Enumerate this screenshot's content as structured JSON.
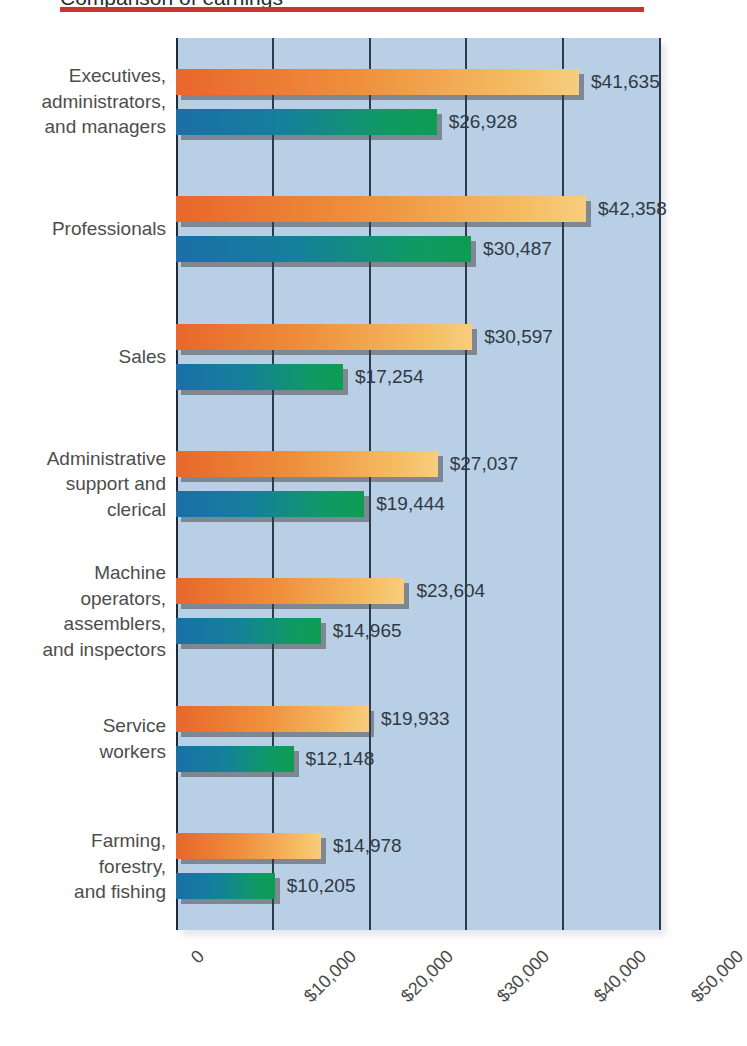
{
  "page": {
    "clipped_headline": "Comparison of earnings",
    "rule_color": "#c0392b",
    "plot_bg": "#b9cfe6"
  },
  "legend": {
    "position": "inside-right",
    "items": [
      {
        "label": "Male",
        "color": "#e8672a"
      },
      {
        "label": "Female",
        "color": "#1b6fa8"
      }
    ]
  },
  "axis": {
    "ticks": [
      "0",
      "$10,000",
      "$20,000",
      "$30,000",
      "$40,000",
      "$50,000"
    ]
  },
  "chart_data": {
    "type": "bar",
    "orientation": "horizontal",
    "title": "",
    "xlabel": "",
    "ylabel": "",
    "xlim": [
      0,
      50000
    ],
    "grid": true,
    "tick_values": [
      0,
      10000,
      20000,
      30000,
      40000,
      50000
    ],
    "tick_labels": [
      "0",
      "$10,000",
      "$20,000",
      "$30,000",
      "$40,000",
      "$50,000"
    ],
    "legend_position": "inside-right",
    "categories": [
      "Executives,\nadministrators,\nand managers",
      "Professionals",
      "Sales",
      "Administrative\nsupport and\nclerical",
      "Machine\noperators,\nassemblers,\nand inspectors",
      "Service\nworkers",
      "Farming,\nforestry,\nand fishing"
    ],
    "series": [
      {
        "name": "Male",
        "color": "#e8672a",
        "values": [
          41635,
          42358,
          30597,
          27037,
          23604,
          19933,
          14978
        ],
        "labels": [
          "$41,635",
          "$42,358",
          "$30,597",
          "$27,037",
          "$23,604",
          "$19,933",
          "$14,978"
        ]
      },
      {
        "name": "Female",
        "color": "#1b6fa8",
        "values": [
          26928,
          30487,
          17254,
          19444,
          14965,
          12148,
          10205
        ],
        "labels": [
          "$26,928",
          "$30,487",
          "$17,254",
          "$19,444",
          "$14,965",
          "$12,148",
          "$10,205"
        ]
      }
    ]
  }
}
